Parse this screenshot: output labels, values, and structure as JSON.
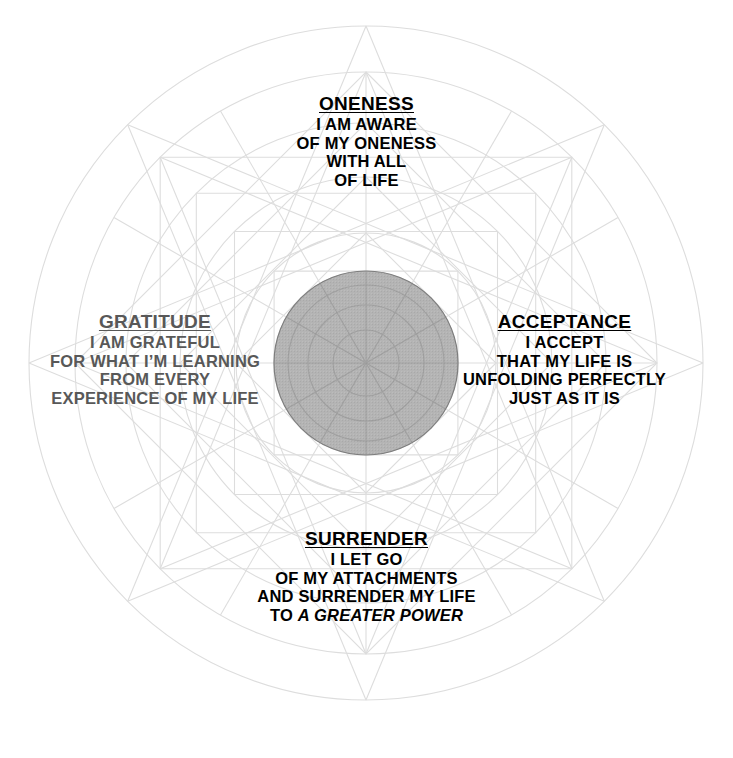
{
  "canvas": {
    "width": 733,
    "height": 758,
    "background": "#ffffff"
  },
  "diagram": {
    "name": "sacred-geometry-mandala",
    "center": {
      "x": 366,
      "y": 363
    },
    "line_color": "#dddddd",
    "line_color_strong": "#d2d2d2",
    "core_disc": {
      "radius": 92,
      "fill": "#b2b2b2",
      "stroke": "#7d7d7d"
    },
    "circle_radii": [
      337,
      291,
      240,
      186,
      130,
      92,
      58,
      33
    ],
    "polygon_radii": [
      291,
      240,
      186,
      130,
      92,
      58
    ],
    "spokes": 12,
    "star_points": 8
  },
  "blocks": {
    "oneness": {
      "color": "#000000",
      "title": "ONENESS",
      "lines": [
        "I AM AWARE",
        "OF MY ONENESS",
        "WITH ALL",
        "OF LIFE"
      ]
    },
    "acceptance": {
      "color": "#000000",
      "title": "ACCEPTANCE",
      "lines": [
        "I ACCEPT",
        "THAT MY LIFE IS",
        "UNFOLDING PERFECTLY",
        "JUST AS IT IS"
      ]
    },
    "surrender": {
      "color": "#000000",
      "title": "SURRENDER",
      "lines_plain": [
        "I LET GO",
        "OF MY ATTACHMENTS",
        "AND SURRENDER MY LIFE"
      ],
      "last_line_prefix": "TO ",
      "last_line_emphasis": "A GREATER POWER"
    },
    "gratitude": {
      "color": "#585858",
      "title": "GRATITUDE",
      "lines": [
        "I AM GRATEFUL",
        "FOR WHAT I’M LEARNING",
        "FROM EVERY",
        "EXPERIENCE OF MY LIFE"
      ]
    }
  }
}
